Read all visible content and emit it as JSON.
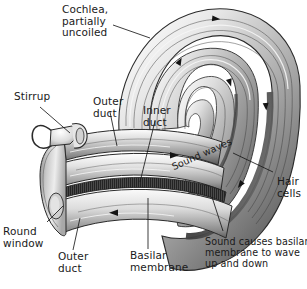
{
  "figure": {
    "background_color": "#ffffff",
    "ink_color": "#1a1a1a"
  },
  "labels": {
    "cochlea_uncoiled": "Cochlea,\npartially\nuncoiled",
    "stirrup": "Stirrup",
    "outer_duct_top": "Outer\nduct",
    "inner_duct": "Inner\nduct",
    "sound_waves": "Sound waves",
    "hair_cells": "Hair\ncells",
    "round_window": "Round\nwindow",
    "outer_duct_bottom": "Outer\nduct",
    "basilar_membrane": "Basilar\nmembrane",
    "sound_causes": "Sound causes basilar\nmembrane to wave\nup and down"
  },
  "structures": {
    "spiral_name": "cochlear-spiral",
    "tube_name": "cochlear-tube",
    "membrane_name": "basilar-membrane-band",
    "stapes_name": "stirrup-bone",
    "round_window_name": "round-window-opening"
  },
  "flow_arrows": {
    "count": 7,
    "meaning": "sound-wave-direction"
  },
  "palette": {
    "shade_light": "#f2f2f2",
    "shade_mid": "#b8b8b8",
    "shade_dark": "#6e6e6e",
    "shade_darkest": "#3c3c3c",
    "membrane": "#4a4a4a",
    "outline": "#2b2b2b"
  }
}
